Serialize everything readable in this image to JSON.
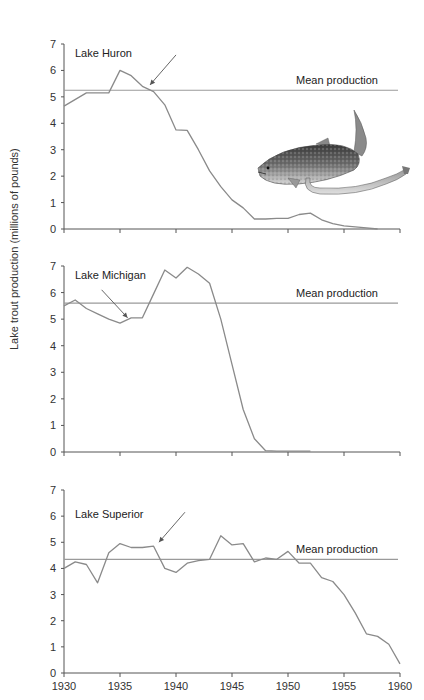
{
  "chart_data": [
    {
      "type": "line",
      "title": "Lake Huron",
      "xlabel": "",
      "ylabel": "Lake trout production (millions of pounds)",
      "xlim": [
        1930,
        1960
      ],
      "ylim": [
        0,
        7
      ],
      "yticks": [
        0,
        1,
        2,
        3,
        4,
        5,
        6,
        7
      ],
      "grid": false,
      "mean_production": 5.25,
      "mean_label": "Mean production",
      "arrow_at": {
        "x": 1937.5,
        "y": 5.3
      },
      "series": [
        {
          "name": "Lake Huron production",
          "x": [
            1930,
            1932,
            1934,
            1935,
            1936,
            1937,
            1938,
            1939,
            1940,
            1941,
            1942,
            1943,
            1944,
            1945,
            1946,
            1947,
            1948,
            1949,
            1950,
            1951,
            1952,
            1953,
            1954,
            1955,
            1956,
            1957,
            1958
          ],
          "y": [
            4.65,
            5.15,
            5.15,
            6.0,
            5.8,
            5.4,
            5.2,
            4.7,
            3.75,
            3.73,
            3.0,
            2.2,
            1.6,
            1.1,
            0.8,
            0.38,
            0.38,
            0.4,
            0.4,
            0.55,
            0.6,
            0.35,
            0.2,
            0.12,
            0.08,
            0.04,
            0.0
          ]
        }
      ]
    },
    {
      "type": "line",
      "title": "Lake Michigan",
      "xlabel": "",
      "ylabel": "Lake trout production (millions of pounds)",
      "xlim": [
        1930,
        1960
      ],
      "ylim": [
        0,
        7
      ],
      "yticks": [
        0,
        1,
        2,
        3,
        4,
        5,
        6,
        7
      ],
      "grid": false,
      "mean_production": 5.6,
      "mean_label": "Mean production",
      "arrow_at": {
        "x": 1935.5,
        "y": 4.9
      },
      "series": [
        {
          "name": "Lake Michigan production",
          "x": [
            1930,
            1931,
            1932,
            1933,
            1934,
            1935,
            1936,
            1937,
            1938,
            1939,
            1940,
            1941,
            1942,
            1943,
            1944,
            1945,
            1946,
            1947,
            1948,
            1949,
            1950,
            1951,
            1952
          ],
          "y": [
            5.5,
            5.72,
            5.4,
            5.2,
            5.0,
            4.85,
            5.05,
            5.05,
            5.95,
            6.85,
            6.55,
            6.95,
            6.7,
            6.35,
            5.0,
            3.3,
            1.6,
            0.5,
            0.05,
            0.03,
            0.03,
            0.03,
            0.03
          ]
        }
      ]
    },
    {
      "type": "line",
      "title": "Lake Superior",
      "xlabel": "",
      "ylabel": "Lake trout production (millions of pounds)",
      "xlim": [
        1930,
        1960
      ],
      "xticks": [
        1930,
        1935,
        1940,
        1945,
        1950,
        1955,
        1960
      ],
      "ylim": [
        0,
        7
      ],
      "yticks": [
        0,
        1,
        2,
        3,
        4,
        5,
        6,
        7
      ],
      "grid": false,
      "mean_production": 4.35,
      "mean_label": "Mean production",
      "arrow_at": {
        "x": 1938.3,
        "y": 4.85
      },
      "series": [
        {
          "name": "Lake Superior production",
          "x": [
            1930,
            1931,
            1932,
            1933,
            1934,
            1935,
            1936,
            1937,
            1938,
            1939,
            1940,
            1941,
            1942,
            1943,
            1944,
            1945,
            1946,
            1947,
            1948,
            1949,
            1950,
            1951,
            1952,
            1953,
            1954,
            1955,
            1956,
            1957,
            1958,
            1959,
            1960
          ],
          "y": [
            4.0,
            4.25,
            4.15,
            3.45,
            4.6,
            4.95,
            4.8,
            4.8,
            4.85,
            4.0,
            3.85,
            4.2,
            4.3,
            4.35,
            5.25,
            4.9,
            4.95,
            4.25,
            4.4,
            4.35,
            4.65,
            4.2,
            4.2,
            3.65,
            3.5,
            3.0,
            2.3,
            1.5,
            1.4,
            1.1,
            0.35
          ]
        }
      ]
    }
  ],
  "panels": {
    "huron": {
      "title": "Lake Huron",
      "mean_label": "Mean production"
    },
    "michigan": {
      "title": "Lake Michigan",
      "mean_label": "Mean production"
    },
    "superior": {
      "title": "Lake Superior",
      "mean_label": "Mean production"
    }
  },
  "axis": {
    "ylabel": "Lake trout production (millions of pounds)",
    "yticks": [
      "0",
      "1",
      "2",
      "3",
      "4",
      "5",
      "6",
      "7"
    ],
    "xticks": [
      "1930",
      "1935",
      "1940",
      "1945",
      "1950",
      "1955",
      "1960"
    ]
  },
  "illustration": {
    "subject": "lake trout with sea lamprey attached"
  },
  "colors": {
    "line": "#8a8a8a",
    "axis": "#555555",
    "mean": "#9a9a9a",
    "arrow": "#555555"
  }
}
